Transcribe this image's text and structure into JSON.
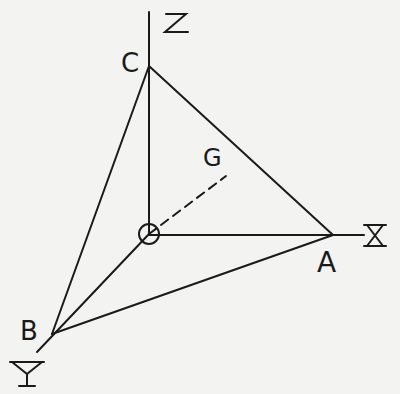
{
  "figure": {
    "colors": {
      "background": "#f3f3f1",
      "ink": "#1a1a1a"
    },
    "axes": {
      "x": {
        "label": "X"
      },
      "y": {
        "label": "Y"
      },
      "z": {
        "label": "Z"
      }
    },
    "points": {
      "origin": {
        "label": "O",
        "marker": "circle"
      },
      "A": {
        "label": "A"
      },
      "B": {
        "label": "B"
      },
      "C": {
        "label": "C"
      },
      "G": {
        "label": "G"
      }
    },
    "segments": [
      {
        "from": "O",
        "to": "A",
        "style": "solid"
      },
      {
        "from": "O",
        "to": "B",
        "style": "solid"
      },
      {
        "from": "O",
        "to": "C",
        "style": "solid"
      },
      {
        "from": "A",
        "to": "B",
        "style": "solid"
      },
      {
        "from": "B",
        "to": "C",
        "style": "solid"
      },
      {
        "from": "C",
        "to": "A",
        "style": "solid"
      },
      {
        "from": "O",
        "to": "G",
        "style": "dashed"
      }
    ]
  }
}
